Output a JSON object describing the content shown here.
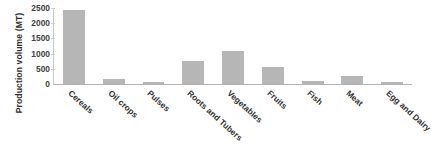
{
  "chart_data": {
    "type": "bar",
    "title": "",
    "xlabel": "",
    "ylabel": "Production  volume (MT)",
    "categories": [
      "Cereals",
      "Oil crops",
      "Pulses",
      "Roots and Tubers",
      "Vegetables",
      "Fruits",
      "Fish",
      "Meat",
      "Egg and Dairy"
    ],
    "values": [
      2450,
      150,
      50,
      750,
      1100,
      550,
      100,
      250,
      50
    ],
    "ylim": [
      0,
      2500
    ],
    "ytick_labels": [
      "0",
      "500",
      "1000",
      "1500",
      "2000",
      "2500"
    ],
    "ytick_values": [
      0,
      500,
      1000,
      1500,
      2000,
      2500
    ],
    "grid": false,
    "legend": "none",
    "bar_color": "#b6b6b6",
    "axis_color": "#b4b4b4",
    "text_color": "#2e2e2e"
  }
}
